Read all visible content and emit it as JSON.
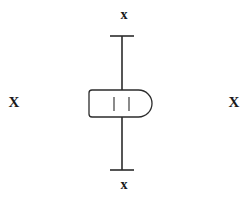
{
  "canvas": {
    "width": 248,
    "height": 198,
    "background_color": "#ffffff",
    "stroke_color": "#2b2b2b",
    "stroke_width": 1.3
  },
  "diagram": {
    "type": "line-drawing",
    "vertical_line": {
      "name": "vertical-shaft",
      "x": 122,
      "y_top": 36,
      "y_bottom": 170,
      "color": "#2b2b2b",
      "width": 1.6
    },
    "terminals": [
      {
        "name": "top-terminal-bar",
        "x_start": 110,
        "x_end": 134,
        "y": 36,
        "width": 1.6
      },
      {
        "name": "bottom-terminal-bar",
        "x_start": 110,
        "x_end": 134,
        "y": 170,
        "width": 1.6
      }
    ],
    "capsule": {
      "name": "capsule-body",
      "x_left": 89,
      "x_right": 152,
      "y_top": 90,
      "y_bottom": 117,
      "left_corner_radius": 3,
      "right_cap": "semicircular",
      "fill": "#ffffff",
      "stroke": "#2b2b2b",
      "stroke_width": 1.3,
      "ticks": [
        {
          "name": "capsule-tick-left",
          "x": 114,
          "y_top": 97,
          "y_bottom": 111
        },
        {
          "name": "capsule-tick-right",
          "x": 129,
          "y_top": 97,
          "y_bottom": 111
        }
      ]
    }
  },
  "markers": {
    "top": {
      "label": "x",
      "case": "lowercase",
      "x": 124,
      "y": 16
    },
    "bottom": {
      "label": "x",
      "case": "lowercase",
      "x": 124,
      "y": 185
    },
    "left": {
      "label": "X",
      "case": "uppercase",
      "x": 14,
      "y": 102
    },
    "right": {
      "label": "X",
      "case": "uppercase",
      "x": 234,
      "y": 102
    }
  }
}
